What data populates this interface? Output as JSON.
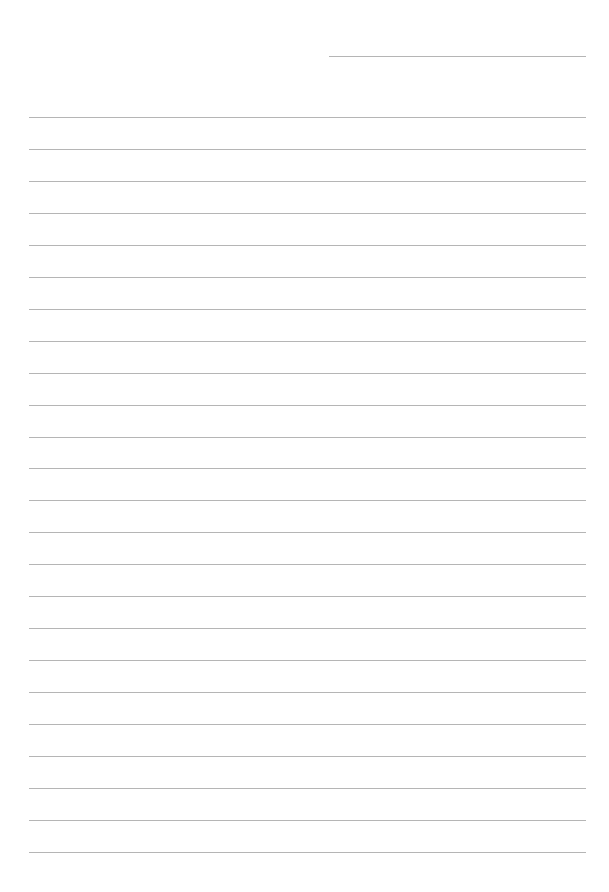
{
  "page": {
    "type": "blank-lined-paper",
    "background": "#ffffff",
    "line_color": "#b5b5b5",
    "header_line": {
      "x1": 329,
      "x2": 586,
      "y": 56
    },
    "ruled_lines": {
      "count": 24,
      "x1": 29,
      "x2": 586,
      "first_y": 117,
      "spacing": 31.95
    }
  }
}
